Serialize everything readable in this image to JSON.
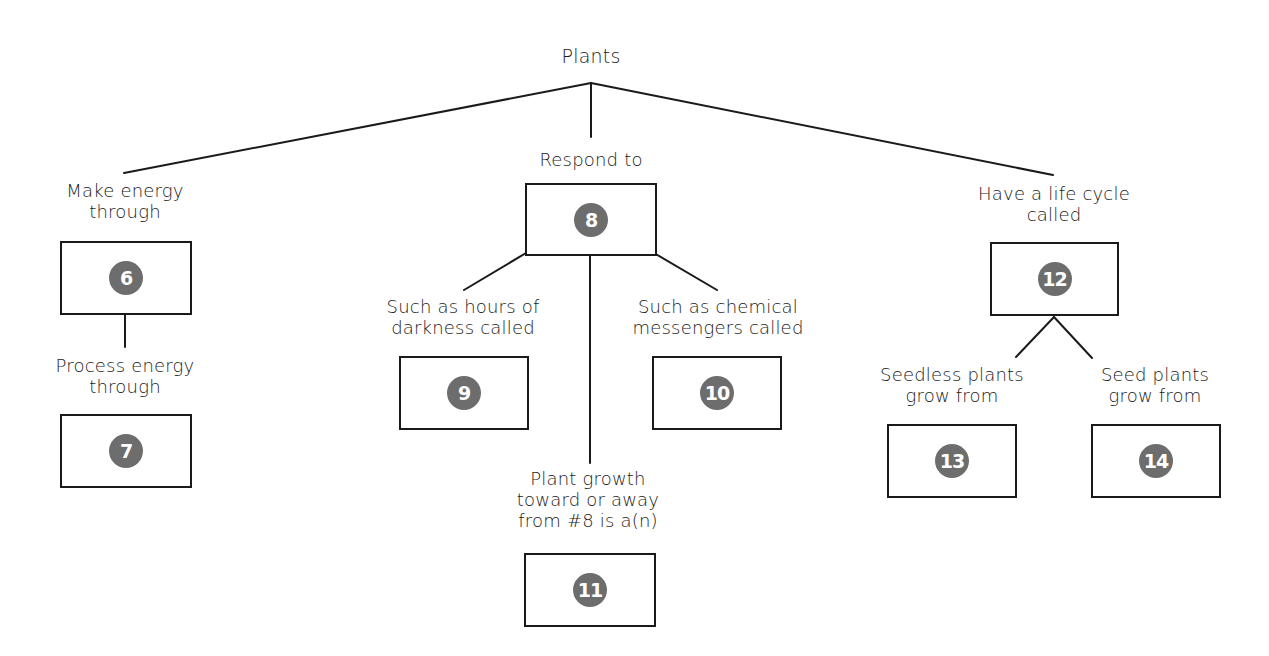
{
  "title": "Plants",
  "branches": {
    "left": {
      "label": "Make energy\nthrough",
      "box": "6",
      "sub_label": "Process energy\nthrough",
      "sub_box": "7"
    },
    "middle": {
      "label": "Respond to",
      "box": "8",
      "left_label": "Such as hours of\ndarkness called",
      "left_box": "9",
      "right_label": "Such as chemical\nmessengers called",
      "right_box": "10",
      "down_label": "Plant growth\ntoward or away\nfrom #8 is a(n)",
      "down_box": "11"
    },
    "right": {
      "label": "Have a life cycle\ncalled",
      "box": "12",
      "left_label": "Seedless plants\ngrow from",
      "left_box": "13",
      "right_label": "Seed plants\ngrow from",
      "right_box": "14"
    }
  },
  "colors": {
    "line": "#1a1a1a",
    "badge": "#6d6d6d",
    "badge_text": "#ffffff"
  }
}
